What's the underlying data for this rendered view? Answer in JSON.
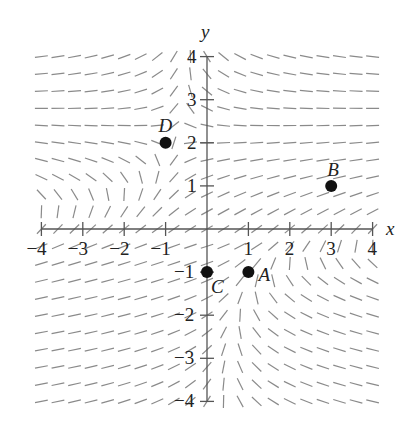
{
  "chart_data": {
    "type": "scatter",
    "title": "",
    "subtitle": "Slope field with labeled points",
    "xlabel": "x",
    "ylabel": "y",
    "xlim": [
      -4,
      4
    ],
    "ylim": [
      -4,
      4
    ],
    "grid": false,
    "x_ticks": [
      -4,
      -3,
      -2,
      -1,
      1,
      2,
      3,
      4
    ],
    "y_ticks": [
      -4,
      -3,
      -2,
      -1,
      1,
      2,
      3,
      4
    ],
    "x_tick_labels": [
      "−4",
      "−3",
      "−2",
      "−1",
      "1",
      "2",
      "3",
      "4"
    ],
    "y_tick_labels": [
      "−4",
      "−3",
      "−2",
      "−1",
      "1",
      "2",
      "3",
      "4"
    ],
    "slope_field": {
      "grid_step": 0.4,
      "x_range": [
        -4,
        4
      ],
      "y_range": [
        -4,
        4
      ],
      "segment_color": "#8a8a8a"
    },
    "points": [
      {
        "label": "A",
        "x": 1,
        "y": -1
      },
      {
        "label": "B",
        "x": 3,
        "y": 1
      },
      {
        "label": "C",
        "x": 0,
        "y": -1
      },
      {
        "label": "D",
        "x": -1,
        "y": 2
      }
    ],
    "legend": null
  },
  "axes": {
    "x_label": "x",
    "y_label": "y",
    "axis_color": "#555555",
    "point_color": "#111111"
  }
}
